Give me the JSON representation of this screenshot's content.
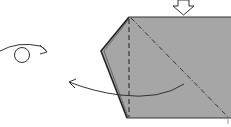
{
  "diagram": {
    "type": "origami-step",
    "colors": {
      "paper_fill": "#a6a6a6",
      "line": "#333333",
      "background": "#ffffff"
    },
    "symbols": [
      {
        "name": "push-arrow",
        "description": "hollow arrow pointing down onto top edge"
      },
      {
        "name": "turn-over",
        "description": "circle with curved arrow indicating turn model over"
      },
      {
        "name": "fold-arrow",
        "description": "curved arrow from right to left"
      },
      {
        "name": "valley-fold",
        "description": "vertical dashed line"
      },
      {
        "name": "mountain-fold",
        "description": "diagonal dash-dot line"
      }
    ]
  }
}
